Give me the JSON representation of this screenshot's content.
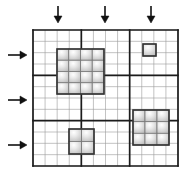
{
  "diagram": {
    "type": "adaptive-mesh-refinement-grid",
    "colors": {
      "background": "#ffffff",
      "fine_line": "#9a9a9a",
      "coarse_line": "#1c1c1c",
      "arrow": "#111111",
      "block_border": "#333333",
      "cell_border": "#787878",
      "cell_highlight": "#ffffff",
      "cell_mid": "#e8e8e8",
      "cell_shadow": "#b2b2b2"
    },
    "grid": {
      "x": 33,
      "y": 30,
      "width": 145,
      "height": 136,
      "fine_cols": 12,
      "fine_rows": 12,
      "coarse_every": 4
    },
    "top_arrows": {
      "direction": "down",
      "xs": [
        58,
        105,
        151
      ],
      "y_start": 6,
      "y_tip": 23,
      "head_width": 8,
      "head_length": 7
    },
    "left_arrows": {
      "direction": "right",
      "ys": [
        55,
        100,
        145
      ],
      "x_start": 8,
      "x_tip": 27,
      "head_width": 8,
      "head_length": 7
    },
    "refined_blocks": [
      {
        "name": "refined-block-4x4",
        "x": 57,
        "y": 49,
        "width": 47,
        "height": 45,
        "cols": 4,
        "rows": 4
      },
      {
        "name": "refined-block-1x1",
        "x": 143,
        "y": 44,
        "width": 13,
        "height": 12,
        "cols": 1,
        "rows": 1
      },
      {
        "name": "refined-block-3x3",
        "x": 133,
        "y": 110,
        "width": 36,
        "height": 35,
        "cols": 3,
        "rows": 3
      },
      {
        "name": "refined-block-2x2",
        "x": 69,
        "y": 129,
        "width": 25,
        "height": 25,
        "cols": 2,
        "rows": 2
      }
    ]
  }
}
